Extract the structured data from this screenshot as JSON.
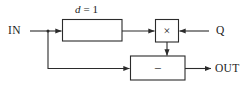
{
  "diagram": {
    "background_color": "#ffffff",
    "line_color": "#2b2b2b",
    "text_color": "#1c1c1c",
    "ports": {
      "input_label": "IN",
      "coefficient_label": "Q",
      "output_label": "OUT"
    },
    "blocks": [
      {
        "id": "delay",
        "label": "",
        "param_prefix": "d",
        "param_suffix": "= 1",
        "param_text": "d = 1"
      },
      {
        "id": "multiplier",
        "symbol": "×",
        "name": "multiply"
      },
      {
        "id": "subtractor",
        "symbol": "−",
        "name": "subtract"
      }
    ]
  }
}
